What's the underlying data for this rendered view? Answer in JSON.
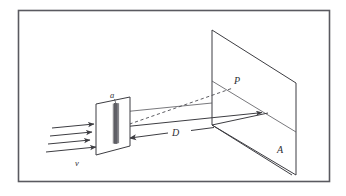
{
  "figure": {
    "kind": "physics-optics-diagram",
    "frame": {
      "border_color": "#5a5a60",
      "background_color": "#ffffff",
      "x": 18,
      "y": 10,
      "width": 312,
      "height": 172
    },
    "line_color": "#3d3d42",
    "labels": {
      "slit_width": "a",
      "wave_speed": "v",
      "distance": "D",
      "point_on_screen": "P",
      "screen": "A"
    },
    "elements": {
      "incoming_wavefront_arrows": 4,
      "slit_plate": "parallelogram-plate-with-vertical-slit",
      "screen_plate": "parallelogram-observation-screen",
      "dashed_ray": "slit-to-P",
      "axis_ray": "slit-to-screen-center-arrow",
      "dimension_line": "double-headed-D-measure"
    },
    "annotations": {
      "a_description": "slit width",
      "v_description": "wave propagation speed",
      "D_description": "slit to screen distance",
      "P_description": "point on screen",
      "A_description": "observation screen"
    }
  }
}
